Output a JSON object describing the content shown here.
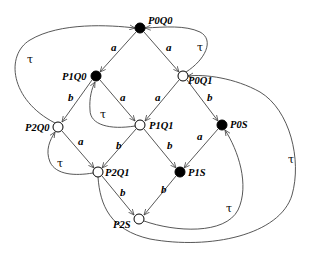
{
  "diagram": {
    "type": "state-transition-graph",
    "states": [
      {
        "id": "P0Q0",
        "label": "P0Q0",
        "style": "filled"
      },
      {
        "id": "P1Q0",
        "label": "P1Q0",
        "style": "filled"
      },
      {
        "id": "P0Q1",
        "label": "P0Q1",
        "style": "open"
      },
      {
        "id": "P2Q0",
        "label": "P2Q0",
        "style": "open"
      },
      {
        "id": "P1Q1",
        "label": "P1Q1",
        "style": "open"
      },
      {
        "id": "P0S",
        "label": "P0S",
        "style": "filled"
      },
      {
        "id": "P2Q1",
        "label": "P2Q1",
        "style": "open"
      },
      {
        "id": "P1S",
        "label": "P1S",
        "style": "filled"
      },
      {
        "id": "P2S",
        "label": "P2S",
        "style": "open"
      }
    ],
    "transitions": [
      {
        "from": "P0Q0",
        "to": "P1Q0",
        "label": "a"
      },
      {
        "from": "P0Q0",
        "to": "P0Q1",
        "label": "a"
      },
      {
        "from": "P0Q1",
        "to": "P0Q0",
        "label": "τ"
      },
      {
        "from": "P2Q0",
        "to": "P0Q0",
        "label": "τ"
      },
      {
        "from": "P1Q0",
        "to": "P2Q0",
        "label": "b"
      },
      {
        "from": "P1Q0",
        "to": "P1Q1",
        "label": "a"
      },
      {
        "from": "P1Q1",
        "to": "P1Q0",
        "label": "τ"
      },
      {
        "from": "P0Q1",
        "to": "P1Q1",
        "label": "a"
      },
      {
        "from": "P0Q1",
        "to": "P0S",
        "label": "b"
      },
      {
        "from": "P1Q1",
        "to": "P2Q1",
        "label": "b"
      },
      {
        "from": "P1Q1",
        "to": "P1S",
        "label": "b"
      },
      {
        "from": "P0S",
        "to": "P1S",
        "label": "a"
      },
      {
        "from": "P2Q0",
        "to": "P2Q1",
        "label": "a"
      },
      {
        "from": "P2Q1",
        "to": "P2Q0",
        "label": "τ"
      },
      {
        "from": "P2Q1",
        "to": "P2S",
        "label": "b"
      },
      {
        "from": "P1S",
        "to": "P2S",
        "label": "b"
      },
      {
        "from": "P2S",
        "to": "P0S",
        "label": "τ"
      },
      {
        "from": "P2Q1",
        "to": "P0Q1",
        "label": "τ"
      }
    ]
  },
  "labels": {
    "a": "a",
    "b": "b",
    "tau": "τ"
  }
}
